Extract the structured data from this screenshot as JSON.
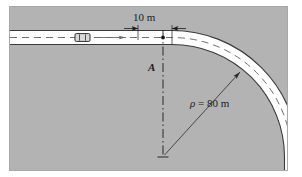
{
  "figure": {
    "background_color": "#b3b3b3",
    "panel_border_color": "#a8a8a8",
    "road_fill_color": "#ffffff",
    "road_edge_color": "#3a3a3a",
    "centerline_color": "#555555",
    "annotation_color": "#1a1a1a"
  },
  "labels": {
    "dimension": "10 m",
    "point_a": "A",
    "radius_symbol": "ρ",
    "radius_equation": " = 80 m",
    "radius_full": "ρ = 80 m"
  },
  "annotations": {
    "dimension_value": 10,
    "dimension_unit": "m",
    "radius_value": 80,
    "radius_unit": "m"
  },
  "elements": {
    "vehicle_label": "car",
    "point_a_marker": "point-marker",
    "center_marker": "plus-cross",
    "travel_arrow": "arrow-right",
    "exit_arrow": "arrow-down",
    "leader_arrow": "arrow-to-curve"
  }
}
